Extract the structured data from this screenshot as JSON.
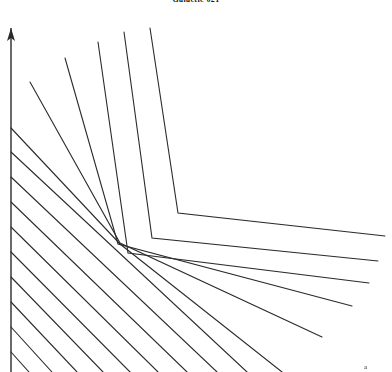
{
  "figure": {
    "title": "Galactic 021",
    "corner_label": "a",
    "width": 392,
    "height": 372,
    "background_color": "#ffffff",
    "stroke_color": "#2b2b2b",
    "stroke_width": 1.1
  },
  "axis": {
    "name": "vertical-axis",
    "orientation": "vertical",
    "x": 11,
    "y_top": 28,
    "y_bottom": 372,
    "arrow_head": "up",
    "arrow_head_length": 13,
    "arrow_head_half_width": 4
  },
  "chart_data": {
    "type": "line",
    "title": "Galactic 021",
    "subtitle": "",
    "xlabel": "",
    "ylabel": "",
    "xlim": [
      0,
      392
    ],
    "ylim": [
      372,
      0
    ],
    "grid": false,
    "legend": null,
    "axes_style": "single-vertical-arrow",
    "series": [
      {
        "name": "elbow-1",
        "kind": "elbow",
        "points": [
          [
            150,
            28
          ],
          [
            178,
            213
          ],
          [
            385,
            236
          ]
        ]
      },
      {
        "name": "elbow-2",
        "kind": "elbow",
        "points": [
          [
            124,
            32
          ],
          [
            152,
            238
          ],
          [
            378,
            261
          ]
        ]
      },
      {
        "name": "elbow-3",
        "kind": "elbow",
        "points": [
          [
            98,
            42
          ],
          [
            128,
            253
          ],
          [
            369,
            283
          ]
        ]
      },
      {
        "name": "elbow-4",
        "kind": "elbow",
        "points": [
          [
            65,
            58
          ],
          [
            118,
            244
          ],
          [
            352,
            306
          ]
        ]
      },
      {
        "name": "ray-1",
        "kind": "ray",
        "points": [
          [
            30,
            82
          ],
          [
            120,
            243
          ],
          [
            322,
            337
          ]
        ]
      },
      {
        "name": "ray-2",
        "kind": "ray",
        "points": [
          [
            11,
            128
          ],
          [
            120,
            244
          ],
          [
            282,
            372
          ]
        ]
      },
      {
        "name": "ray-3",
        "kind": "ray",
        "points": [
          [
            11,
            152
          ],
          [
            247,
            372
          ]
        ]
      },
      {
        "name": "ray-4",
        "kind": "ray",
        "points": [
          [
            11,
            177
          ],
          [
            217,
            372
          ]
        ]
      },
      {
        "name": "ray-5",
        "kind": "ray",
        "points": [
          [
            11,
            202
          ],
          [
            187,
            372
          ]
        ]
      },
      {
        "name": "ray-6",
        "kind": "ray",
        "points": [
          [
            11,
            227
          ],
          [
            158,
            372
          ]
        ]
      },
      {
        "name": "ray-7",
        "kind": "ray",
        "points": [
          [
            11,
            252
          ],
          [
            130,
            372
          ]
        ]
      },
      {
        "name": "ray-8",
        "kind": "ray",
        "points": [
          [
            11,
            277
          ],
          [
            103,
            372
          ]
        ]
      },
      {
        "name": "ray-9",
        "kind": "ray",
        "points": [
          [
            11,
            302
          ],
          [
            77,
            372
          ]
        ]
      },
      {
        "name": "ray-10",
        "kind": "ray",
        "points": [
          [
            11,
            327
          ],
          [
            52,
            372
          ]
        ]
      },
      {
        "name": "ray-11",
        "kind": "ray",
        "points": [
          [
            11,
            352
          ],
          [
            29,
            372
          ]
        ]
      }
    ]
  }
}
